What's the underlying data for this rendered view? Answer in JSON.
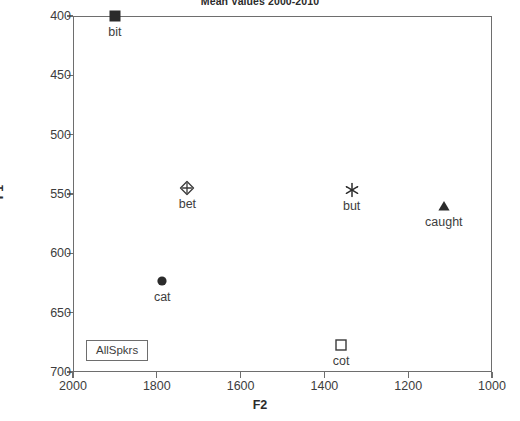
{
  "chart_data": {
    "type": "scatter",
    "title": "Mean Values 2000-2010",
    "xlabel": "F2",
    "ylabel": "F1",
    "xlim": [
      2000,
      1000
    ],
    "ylim": [
      700,
      400
    ],
    "x_inverted": true,
    "y_inverted": true,
    "grid": false,
    "legend_position": "bottom-left",
    "legend_entries": [
      "AllSpkrs"
    ],
    "xticks": [
      2000,
      1800,
      1600,
      1400,
      1200,
      1000
    ],
    "yticks": [
      400,
      450,
      500,
      550,
      600,
      650,
      700
    ],
    "xtick_labels": [
      "2000",
      "1800",
      "1600",
      "1400",
      "1200",
      "1000"
    ],
    "ytick_labels": [
      "400",
      "450",
      "500",
      "550",
      "600",
      "650",
      "700"
    ],
    "points": [
      {
        "label": "bit",
        "x": 1900,
        "y": 400,
        "marker": "filled-square",
        "color": "#2b2b2b"
      },
      {
        "label": "bet",
        "x": 1727,
        "y": 545,
        "marker": "diamond-cross",
        "color": "#3a3a3a"
      },
      {
        "label": "cat",
        "x": 1787,
        "y": 623,
        "marker": "filled-circle",
        "color": "#2b2b2b"
      },
      {
        "label": "but",
        "x": 1335,
        "y": 547,
        "marker": "asterisk",
        "color": "#2b2b2b"
      },
      {
        "label": "caught",
        "x": 1115,
        "y": 560,
        "marker": "filled-triangle",
        "color": "#2b2b2b"
      },
      {
        "label": "cot",
        "x": 1360,
        "y": 677,
        "marker": "open-square",
        "color": "#3a3a3a"
      }
    ]
  },
  "colors": {
    "axis": "#6e6e6e",
    "text": "#3d3d3d",
    "background": "#ffffff",
    "marker": "#2b2b2b"
  }
}
